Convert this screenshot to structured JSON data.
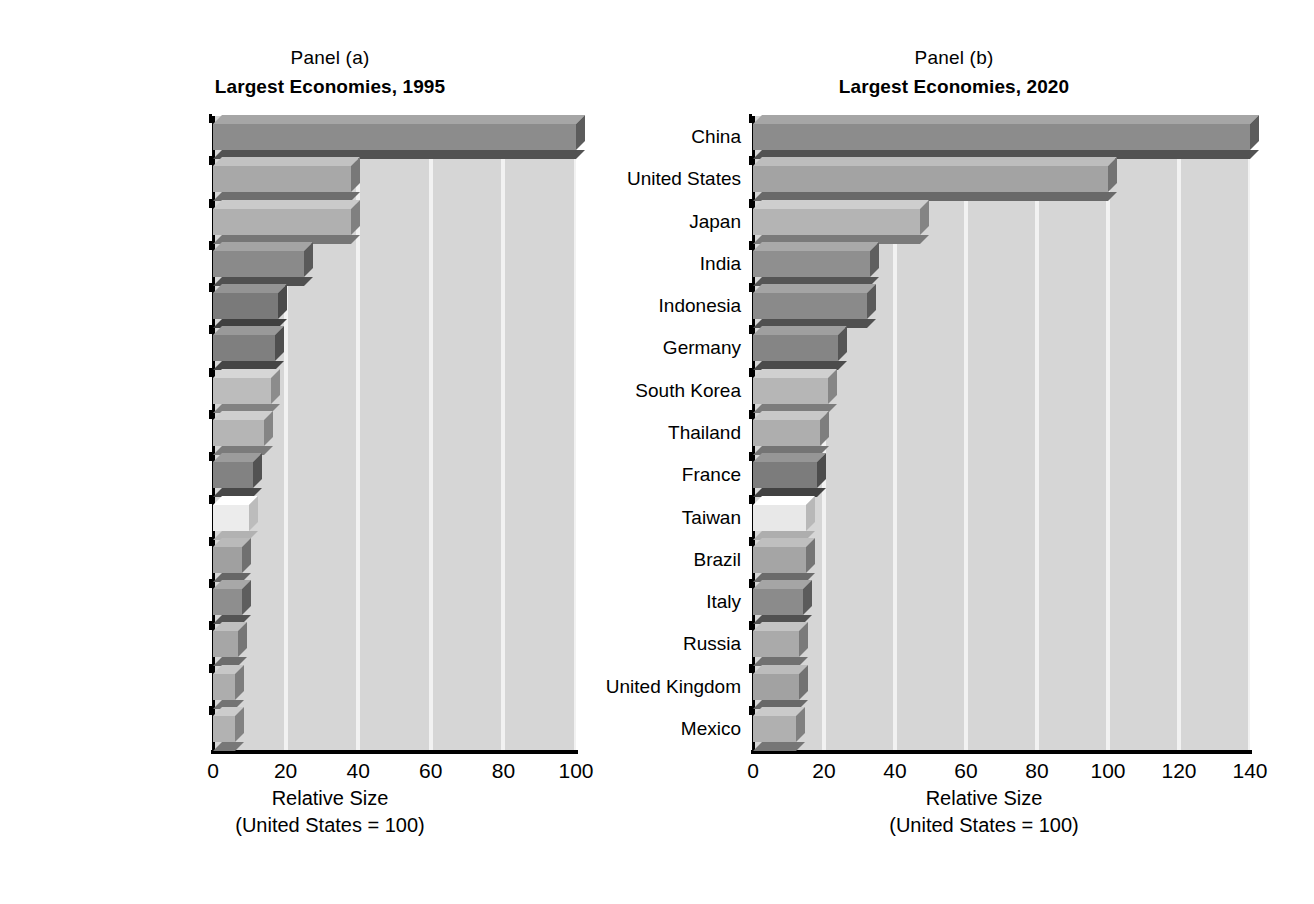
{
  "chart_data": [
    {
      "type": "bar",
      "orientation": "horizontal",
      "panel_caption": "Panel (a)",
      "title": "Largest Economies, 1995",
      "xlabel_line1": "Relative Size",
      "xlabel_line2": "(United States = 100)",
      "ylabel": "",
      "xlim": [
        0,
        100
      ],
      "xticks": [
        0,
        20,
        40,
        60,
        80,
        100
      ],
      "grid": true,
      "grid_axis": "x",
      "legend": "none",
      "categories": [
        "United States",
        "Japan",
        "China",
        "Germany",
        "France",
        "India",
        "Italy",
        "United Kingdom",
        "Russia",
        "Brazil",
        "Mexico",
        "Indonesia",
        "Canada",
        "Spain",
        "South Korea"
      ],
      "values": [
        100,
        38,
        38,
        25,
        18,
        17,
        16,
        14,
        11,
        10,
        8,
        8,
        7,
        6,
        6
      ]
    },
    {
      "type": "bar",
      "orientation": "horizontal",
      "panel_caption": "Panel (b)",
      "title": "Largest Economies, 2020",
      "xlabel_line1": "Relative Size",
      "xlabel_line2": "(United States = 100)",
      "ylabel": "",
      "xlim": [
        0,
        140
      ],
      "xticks": [
        0,
        20,
        40,
        60,
        80,
        100,
        120,
        140
      ],
      "grid": true,
      "grid_axis": "x",
      "legend": "none",
      "categories": [
        "China",
        "United States",
        "Japan",
        "India",
        "Indonesia",
        "Germany",
        "South Korea",
        "Thailand",
        "France",
        "Taiwan",
        "Brazil",
        "Italy",
        "Russia",
        "United Kingdom",
        "Mexico"
      ],
      "values": [
        140,
        100,
        47,
        33,
        32,
        24,
        21,
        19,
        18,
        15,
        15,
        14,
        13,
        13,
        12
      ]
    }
  ],
  "style": {
    "plot_background": "#d6d6d6",
    "gridline_color": "#f2f2f2",
    "axis_color": "#000000",
    "bar_palette": [
      "#8c8c8c",
      "#a8a8a8",
      "#b0b0b0",
      "#8a8a8a",
      "#7a7a7a",
      "#7f7f7f",
      "#bcbcbc",
      "#b5b5b5",
      "#828282",
      "#ececec",
      "#a0a0a0",
      "#8e8e8e",
      "#a6a6a6",
      "#adadad",
      "#b2b2b2"
    ],
    "bar_palette_b": [
      "#8c8c8c",
      "#a3a3a3",
      "#b4b4b4",
      "#8f8f8f",
      "#8a8a8a",
      "#858585",
      "#b6b6b6",
      "#aeaeae",
      "#7c7c7c",
      "#e8e8e8",
      "#a5a5a5",
      "#8b8b8b",
      "#aaaaaa",
      "#a2a2a2",
      "#b0b0b0"
    ]
  }
}
